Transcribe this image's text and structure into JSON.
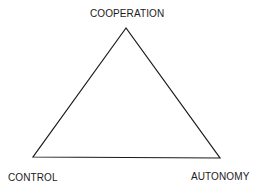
{
  "diagram": {
    "type": "triangle",
    "stroke_color": "#1a1a1a",
    "vertices": {
      "top": {
        "label": "COOPERATION",
        "x": 126,
        "y": 28
      },
      "bottom_left": {
        "label": "CONTROL",
        "x": 33,
        "y": 157
      },
      "bottom_right": {
        "label": "AUTONOMY",
        "x": 220,
        "y": 158
      }
    }
  }
}
